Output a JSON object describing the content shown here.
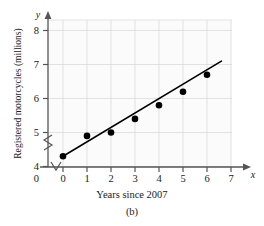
{
  "figure": {
    "caption": "(b)",
    "xlabel": "Years since 2007",
    "ylabel": "Registered motorcycles (millions)",
    "axis_letter_x": "x",
    "axis_letter_y": "y"
  },
  "colors": {
    "axis": "#555555",
    "grid": "#dcdcdc",
    "point": "#000000",
    "line": "#000000",
    "text": "#1a1a1a",
    "plot_background": "#fbfbfb"
  },
  "chart_data": {
    "type": "scatter",
    "title": "",
    "xlabel": "Years since 2007",
    "ylabel": "Registered motorcycles (millions)",
    "xlim": [
      0,
      7
    ],
    "ylim": [
      4,
      8.3
    ],
    "xticks": [
      "0",
      "1",
      "2",
      "3",
      "4",
      "5",
      "6",
      "7"
    ],
    "yticks": [
      "4",
      "5",
      "6",
      "7",
      "8"
    ],
    "grid": true,
    "legend": "none",
    "axis_break_x": true,
    "axis_break_y": true,
    "origin_label": "0",
    "x": [
      0,
      1,
      2,
      3,
      4,
      5,
      6
    ],
    "values": [
      4.3,
      4.9,
      5.0,
      5.4,
      5.8,
      6.2,
      6.7
    ],
    "series": [
      {
        "name": "Registered motorcycles",
        "x": [
          0,
          1,
          2,
          3,
          4,
          5,
          6
        ],
        "values": [
          4.3,
          4.9,
          5.0,
          5.4,
          5.8,
          6.2,
          6.7
        ]
      }
    ],
    "trendline": {
      "type": "linear",
      "x_start": 0,
      "y_start": 4.3,
      "x_end": 6.6,
      "y_end": 7.1
    }
  }
}
